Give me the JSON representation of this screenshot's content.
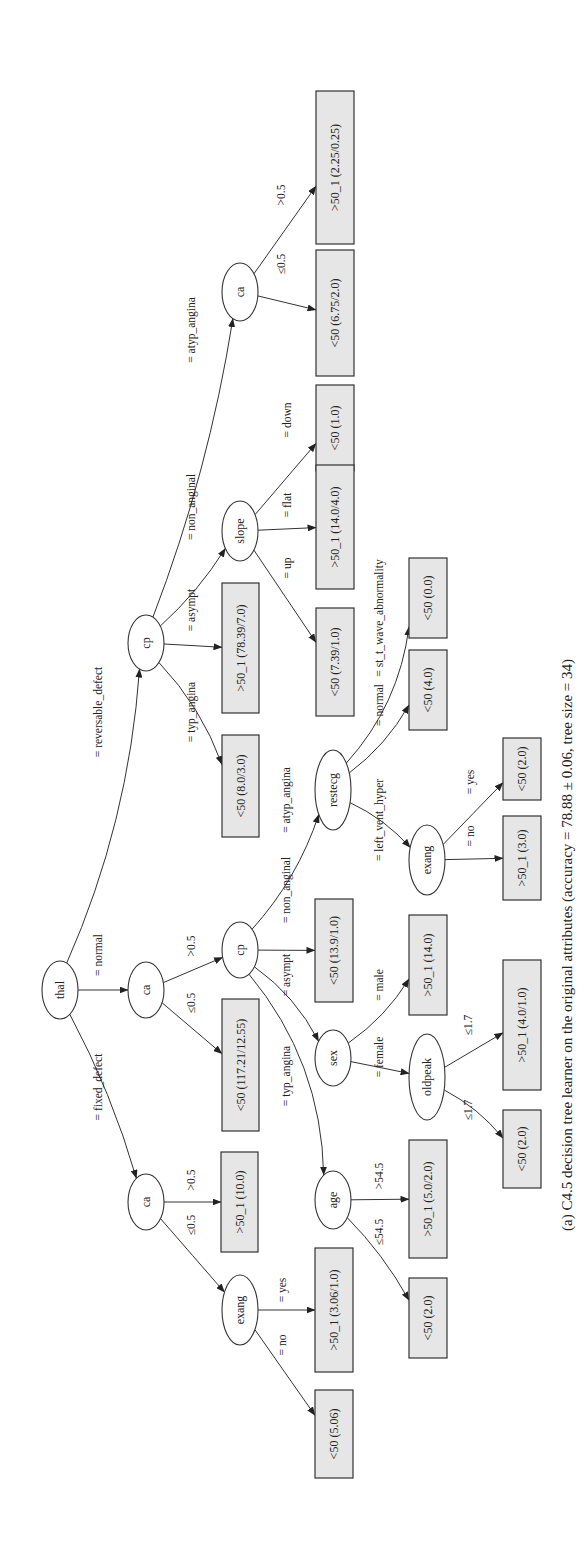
{
  "figure": {
    "caption": "(a) C4.5 decision tree learner on the original attributes (accuracy = 78.88 ± 0.06, tree size = 34)",
    "leaf_fill": "#e6e6e6",
    "stroke": "#333333"
  },
  "tree": {
    "nodes": [
      {
        "id": "thal",
        "label": "thal",
        "type": "split",
        "x": 60,
        "y": 990,
        "rx": 18,
        "ry": 29
      },
      {
        "id": "cp_rev",
        "label": "cp",
        "type": "split",
        "x": 146,
        "y": 643,
        "rx": 18,
        "ry": 28
      },
      {
        "id": "ca_norm",
        "label": "ca",
        "type": "split",
        "x": 146,
        "y": 990,
        "rx": 18,
        "ry": 28
      },
      {
        "id": "ca_fix",
        "label": "ca",
        "type": "split",
        "x": 146,
        "y": 1202,
        "rx": 18,
        "ry": 28
      },
      {
        "id": "ca_atyp",
        "label": "ca",
        "type": "split",
        "x": 240,
        "y": 292,
        "rx": 18,
        "ry": 29
      },
      {
        "id": "slope",
        "label": "slope",
        "type": "split",
        "x": 240,
        "y": 531,
        "rx": 18,
        "ry": 30
      },
      {
        "id": "cp_ca",
        "label": "cp",
        "type": "split",
        "x": 240,
        "y": 950,
        "rx": 18,
        "ry": 28
      },
      {
        "id": "exang_fix",
        "label": "exang",
        "type": "split",
        "x": 240,
        "y": 1310,
        "rx": 18,
        "ry": 35
      },
      {
        "id": "restecg",
        "label": "restecg",
        "type": "split",
        "x": 333,
        "y": 790,
        "rx": 18,
        "ry": 40
      },
      {
        "id": "sex",
        "label": "sex",
        "type": "split",
        "x": 333,
        "y": 1058,
        "rx": 18,
        "ry": 28
      },
      {
        "id": "age",
        "label": "age",
        "type": "split",
        "x": 333,
        "y": 1200,
        "rx": 18,
        "ry": 29
      },
      {
        "id": "exang_rest",
        "label": "exang",
        "type": "split",
        "x": 427,
        "y": 860,
        "rx": 18,
        "ry": 35
      },
      {
        "id": "oldpeak",
        "label": "oldpeak",
        "type": "split",
        "x": 427,
        "y": 1077,
        "rx": 18,
        "ry": 43
      },
      {
        "id": "l_ca_atyp_gt",
        "label": ">50_1 (2.25/0.25)",
        "type": "leaf",
        "x": 316,
        "y": 91,
        "w": 38,
        "h": 153
      },
      {
        "id": "l_ca_atyp_le",
        "label": "<50 (6.75/2.0)",
        "type": "leaf",
        "x": 316,
        "y": 250,
        "w": 38,
        "h": 126
      },
      {
        "id": "l_slope_down",
        "label": "<50 (1.0)",
        "type": "leaf",
        "x": 316,
        "y": 385,
        "w": 38,
        "h": 86
      },
      {
        "id": "l_slope_flat",
        "label": ">50_1 (14.0/4.0)",
        "type": "leaf",
        "x": 316,
        "y": 465,
        "w": 38,
        "h": 124
      },
      {
        "id": "l_slope_up",
        "label": "<50 (7.39/1.0)",
        "type": "leaf",
        "x": 316,
        "y": 608,
        "w": 38,
        "h": 108
      },
      {
        "id": "l_cp_asympt",
        "label": ">50_1 (78.39/7.0)",
        "type": "leaf",
        "x": 222,
        "y": 583,
        "w": 37,
        "h": 130
      },
      {
        "id": "l_cp_typ",
        "label": "<50 (8.0/3.0)",
        "type": "leaf",
        "x": 222,
        "y": 735,
        "w": 37,
        "h": 102
      },
      {
        "id": "l_cpca_asympt",
        "label": "<50 (13.9/1.0)",
        "type": "leaf",
        "x": 315,
        "y": 899,
        "w": 38,
        "h": 103
      },
      {
        "id": "l_ca_norm_le",
        "label": "<50 (117.21/12.55)",
        "type": "leaf",
        "x": 222,
        "y": 999,
        "w": 37,
        "h": 132
      },
      {
        "id": "l_ca_fix_gt",
        "label": ">50_1 (10.0)",
        "type": "leaf",
        "x": 221,
        "y": 1152,
        "w": 37,
        "h": 100
      },
      {
        "id": "l_exang_fix_yes",
        "label": ">50_1 (3.06/1.0)",
        "type": "leaf",
        "x": 315,
        "y": 1248,
        "w": 38,
        "h": 124
      },
      {
        "id": "l_exang_fix_no",
        "label": "<50 (5.06)",
        "type": "leaf",
        "x": 315,
        "y": 1390,
        "w": 38,
        "h": 88
      },
      {
        "id": "l_rest_st",
        "label": "<50 (0.0)",
        "type": "leaf",
        "x": 409,
        "y": 558,
        "w": 38,
        "h": 80
      },
      {
        "id": "l_rest_normal",
        "label": "<50 (4.0)",
        "type": "leaf",
        "x": 409,
        "y": 650,
        "w": 38,
        "h": 80
      },
      {
        "id": "l_exang_rest_yes",
        "label": "<50 (2.0)",
        "type": "leaf",
        "x": 503,
        "y": 738,
        "w": 38,
        "h": 62
      },
      {
        "id": "l_exang_rest_no",
        "label": ">50_1 (3.0)",
        "type": "leaf",
        "x": 503,
        "y": 816,
        "w": 38,
        "h": 84
      },
      {
        "id": "l_sex_male",
        "label": ">50_1 (14.0)",
        "type": "leaf",
        "x": 409,
        "y": 915,
        "w": 38,
        "h": 100
      },
      {
        "id": "l_oldpeak_a",
        "label": ">50_1 (4.0/1.0)",
        "type": "leaf",
        "x": 503,
        "y": 960,
        "w": 38,
        "h": 130
      },
      {
        "id": "l_oldpeak_b",
        "label": "<50 (2.0)",
        "type": "leaf",
        "x": 503,
        "y": 1110,
        "w": 38,
        "h": 78
      },
      {
        "id": "l_age_gt",
        "label": ">50_1 (5.0/2.0)",
        "type": "leaf",
        "x": 409,
        "y": 1140,
        "w": 38,
        "h": 118
      },
      {
        "id": "l_age_le",
        "label": "<50 (2.0)",
        "type": "leaf",
        "x": 409,
        "y": 1278,
        "w": 38,
        "h": 80
      }
    ],
    "edges": [
      {
        "from": "thal",
        "to": "cp_rev",
        "label": "= reversable_defect",
        "lx": 102,
        "ly": 712,
        "curve": 0.25
      },
      {
        "from": "thal",
        "to": "ca_norm",
        "label": "= normal",
        "lx": 102,
        "ly": 955,
        "curve": 0
      },
      {
        "from": "thal",
        "to": "ca_fix",
        "label": "= fixed_defect",
        "lx": 102,
        "ly": 1087,
        "curve": -0.15
      },
      {
        "from": "cp_rev",
        "to": "ca_atyp",
        "label": "= atyp_angina",
        "lx": 195,
        "ly": 330,
        "curve": 0.15
      },
      {
        "from": "cp_rev",
        "to": "slope",
        "label": "= non_anginal",
        "lx": 195,
        "ly": 507,
        "curve": 0.2
      },
      {
        "from": "cp_rev",
        "to": "l_cp_asympt",
        "label": "= asympt",
        "lx": 195,
        "ly": 610,
        "curve": 0
      },
      {
        "from": "cp_rev",
        "to": "l_cp_typ",
        "label": "= typ_angina",
        "lx": 195,
        "ly": 712,
        "curve": -0.3
      },
      {
        "from": "ca_norm",
        "to": "cp_ca",
        "label": ">0.5",
        "lx": 195,
        "ly": 946,
        "curve": 0
      },
      {
        "from": "ca_norm",
        "to": "l_ca_norm_le",
        "label": "≤0.5",
        "lx": 195,
        "ly": 1003,
        "curve": 0
      },
      {
        "from": "ca_fix",
        "to": "l_ca_fix_gt",
        "label": ">0.5",
        "lx": 195,
        "ly": 1180,
        "curve": 0
      },
      {
        "from": "ca_fix",
        "to": "exang_fix",
        "label": "≤0.5",
        "lx": 195,
        "ly": 1225,
        "curve": 0
      },
      {
        "from": "ca_atyp",
        "to": "l_ca_atyp_le",
        "label": "≤0.5",
        "lx": 285,
        "ly": 264,
        "curve": 0
      },
      {
        "from": "ca_atyp",
        "to": "l_ca_atyp_gt",
        "label": ">0.5",
        "lx": 285,
        "ly": 195,
        "curve": 0
      },
      {
        "from": "slope",
        "to": "l_slope_down",
        "label": "= down",
        "lx": 291,
        "ly": 420,
        "curve": 0
      },
      {
        "from": "slope",
        "to": "l_slope_flat",
        "label": "= flat",
        "lx": 291,
        "ly": 505,
        "curve": 0
      },
      {
        "from": "slope",
        "to": "l_slope_up",
        "label": "= up",
        "lx": 291,
        "ly": 568,
        "curve": 0
      },
      {
        "from": "cp_ca",
        "to": "restecg",
        "label": "= atyp_angina",
        "lx": 290,
        "ly": 800,
        "curve": 0.3
      },
      {
        "from": "cp_ca",
        "to": "l_cpca_asympt",
        "label": "= non_anginal",
        "lx": 290,
        "ly": 890,
        "curve": 0
      },
      {
        "from": "cp_ca",
        "to": "sex",
        "label": "= asympt",
        "lx": 290,
        "ly": 975,
        "curve": -0.35
      },
      {
        "from": "cp_ca",
        "to": "age",
        "label": "= typ_angina",
        "lx": 290,
        "ly": 1076,
        "curve": -0.5
      },
      {
        "from": "exang_fix",
        "to": "l_exang_fix_yes",
        "label": "= yes",
        "lx": 286,
        "ly": 1290,
        "curve": 0
      },
      {
        "from": "exang_fix",
        "to": "l_exang_fix_no",
        "label": "= no",
        "lx": 286,
        "ly": 1345,
        "curve": 0
      },
      {
        "from": "restecg",
        "to": "l_rest_st",
        "label": "= st_t_wave_abnormality",
        "lx": 383,
        "ly": 618,
        "curve": 0.45
      },
      {
        "from": "restecg",
        "to": "l_rest_normal",
        "label": "= normal",
        "lx": 383,
        "ly": 705,
        "curve": 0.3
      },
      {
        "from": "restecg",
        "to": "exang_rest",
        "label": "= left_vent_hyper",
        "lx": 383,
        "ly": 820,
        "curve": -0.3
      },
      {
        "from": "sex",
        "to": "l_sex_male",
        "label": "= male",
        "lx": 383,
        "ly": 985,
        "curve": 0.3
      },
      {
        "from": "sex",
        "to": "oldpeak",
        "label": "= female",
        "lx": 383,
        "ly": 1057,
        "curve": 0
      },
      {
        "from": "age",
        "to": "l_age_gt",
        "label": ">54.5",
        "lx": 383,
        "ly": 1176,
        "curve": 0
      },
      {
        "from": "age",
        "to": "l_age_le",
        "label": "≤54.5",
        "lx": 383,
        "ly": 1232,
        "curve": -0.2
      },
      {
        "from": "exang_rest",
        "to": "l_exang_rest_yes",
        "label": "= yes",
        "lx": 474,
        "ly": 782,
        "curve": 0
      },
      {
        "from": "exang_rest",
        "to": "l_exang_rest_no",
        "label": "= no",
        "lx": 474,
        "ly": 836,
        "curve": 0
      },
      {
        "from": "oldpeak",
        "to": "l_oldpeak_a",
        "label": "≤1.7",
        "lx": 472,
        "ly": 1025,
        "curve": 0
      },
      {
        "from": "oldpeak",
        "to": "l_oldpeak_b",
        "label": "≤1.7",
        "lx": 472,
        "ly": 1110,
        "curve": -0.3
      }
    ]
  }
}
